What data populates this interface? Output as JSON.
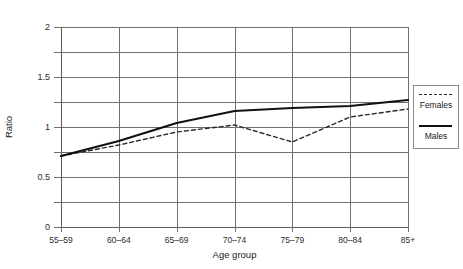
{
  "chart_data": {
    "type": "line",
    "title": "",
    "clipped_top_text": "",
    "xlabel": "Age group",
    "ylabel": "Ratio",
    "categories": [
      "55–59",
      "60–64",
      "65–69",
      "70–74",
      "75–79",
      "80–84",
      "85+"
    ],
    "ylim": [
      0,
      2
    ],
    "ytick_labels": [
      "0",
      "0.5",
      "1",
      "1.5",
      "2"
    ],
    "ytick_values": [
      0,
      0.5,
      1,
      1.5,
      2
    ],
    "yminor_values": [
      0.25,
      0.75,
      1.25,
      1.75
    ],
    "grid": "both",
    "legend_position": "right",
    "series": [
      {
        "name": "Females",
        "style": "dashed",
        "color": "#2a2a2a",
        "values": [
          0.71,
          0.82,
          0.95,
          1.02,
          0.85,
          1.1,
          1.18
        ]
      },
      {
        "name": "Males",
        "style": "solid",
        "color": "#111111",
        "values": [
          0.71,
          0.86,
          1.04,
          1.16,
          1.19,
          1.21,
          1.27
        ]
      }
    ]
  },
  "legend": {
    "entries": [
      {
        "label": "Females",
        "swatch": "dashed-line-swatch"
      },
      {
        "label": "Males",
        "swatch": "solid-line-swatch"
      }
    ]
  }
}
